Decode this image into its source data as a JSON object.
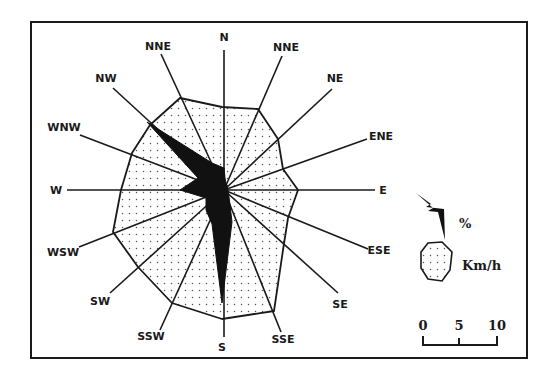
{
  "figure": {
    "type": "wind-rose",
    "frame": {
      "x": 31,
      "y": 22,
      "width": 496,
      "height": 336
    },
    "center": {
      "x": 224,
      "y": 190
    },
    "colors": {
      "line": "#1a1a1a",
      "fill_dots": "#555555",
      "spike": "#111111",
      "background": "#ffffff"
    }
  },
  "directions": [
    {
      "label": "N",
      "line_end": [
        224,
        50
      ],
      "label_pos": [
        224,
        41
      ],
      "speed_vertex": [
        222,
        107
      ],
      "pct_vertex": [
        224,
        168
      ]
    },
    {
      "label": "NNE",
      "line_end": [
        161,
        54
      ],
      "label_pos": [
        158,
        50
      ],
      "speed_vertex": [
        180,
        98
      ],
      "pct_vertex": [
        212,
        163
      ]
    },
    {
      "label": "NW",
      "line_end": [
        113,
        88
      ],
      "label_pos": [
        106,
        82
      ],
      "speed_vertex": [
        150,
        125
      ],
      "pct_vertex": [
        147,
        122
      ]
    },
    {
      "label": "WNW",
      "line_end": [
        80,
        135
      ],
      "label_pos": [
        64,
        131
      ],
      "speed_vertex": [
        132,
        153
      ],
      "pct_vertex": [
        198,
        178
      ]
    },
    {
      "label": "W",
      "line_end": [
        67,
        190
      ],
      "label_pos": [
        56,
        194
      ],
      "speed_vertex": [
        121,
        190
      ],
      "pct_vertex": [
        180,
        190
      ]
    },
    {
      "label": "WSW",
      "line_end": [
        79,
        247
      ],
      "label_pos": [
        63,
        256
      ],
      "speed_vertex": [
        113,
        232
      ],
      "pct_vertex": [
        206,
        198
      ]
    },
    {
      "label": "SW",
      "line_end": [
        110,
        293
      ],
      "label_pos": [
        100,
        305
      ],
      "speed_vertex": [
        138,
        267
      ],
      "pct_vertex": [
        206,
        210
      ]
    },
    {
      "label": "SSW",
      "line_end": [
        160,
        330
      ],
      "label_pos": [
        151,
        340
      ],
      "speed_vertex": [
        172,
        303
      ],
      "pct_vertex": [
        212,
        224
      ]
    },
    {
      "label": "S",
      "line_end": [
        224,
        337
      ],
      "label_pos": [
        222,
        351
      ],
      "speed_vertex": [
        222,
        319
      ],
      "pct_vertex": [
        222,
        303
      ]
    },
    {
      "label": "SSE",
      "line_end": [
        281,
        332
      ],
      "label_pos": [
        283,
        343
      ],
      "speed_vertex": [
        274,
        311
      ],
      "pct_vertex": [
        232,
        222
      ]
    },
    {
      "label": "SE",
      "line_end": [
        338,
        293
      ],
      "label_pos": [
        340,
        308
      ],
      "speed_vertex": [
        283,
        250
      ],
      "pct_vertex": [
        230,
        205
      ]
    },
    {
      "label": "ESE",
      "line_end": [
        368,
        249
      ],
      "label_pos": [
        379,
        254
      ],
      "speed_vertex": [
        288,
        218
      ],
      "pct_vertex": [
        229,
        197
      ]
    },
    {
      "label": "E",
      "line_end": [
        375,
        190
      ],
      "label_pos": [
        383,
        194
      ],
      "speed_vertex": [
        298,
        190
      ],
      "pct_vertex": [
        228,
        191
      ]
    },
    {
      "label": "ENE",
      "line_end": [
        367,
        139
      ],
      "label_pos": [
        381,
        140
      ],
      "speed_vertex": [
        283,
        169
      ],
      "pct_vertex": [
        227,
        186
      ]
    },
    {
      "label": "NE",
      "line_end": [
        332,
        89
      ],
      "label_pos": [
        335,
        82
      ],
      "speed_vertex": [
        278,
        139
      ],
      "pct_vertex": [
        226,
        183
      ]
    },
    {
      "label": "NNE",
      "line_end": [
        282,
        56
      ],
      "label_pos": [
        286,
        51
      ],
      "speed_vertex": [
        258,
        109
      ],
      "pct_vertex": [
        225,
        178
      ]
    }
  ],
  "legend": {
    "spike_label": "%",
    "polygon_label": "Km/h",
    "spike_points": [
      [
        416,
        193
      ],
      [
        431,
        204
      ],
      [
        426,
        207
      ],
      [
        444,
        209
      ],
      [
        445,
        240
      ],
      [
        438,
        212
      ],
      [
        428,
        211
      ],
      [
        433,
        208
      ]
    ],
    "polygon_points": [
      [
        428,
        243
      ],
      [
        442,
        242
      ],
      [
        452,
        252
      ],
      [
        450,
        270
      ],
      [
        442,
        281
      ],
      [
        428,
        279
      ],
      [
        421,
        268
      ],
      [
        421,
        252
      ]
    ],
    "spike_label_pos": [
      459,
      228
    ],
    "polygon_label_pos": [
      462,
      270
    ]
  },
  "scale_bar": {
    "ticks": [
      {
        "label": "0",
        "x": 423
      },
      {
        "label": "5",
        "x": 459
      },
      {
        "label": "10",
        "x": 497
      }
    ],
    "baseline_y": 345,
    "tick_top_y": 336,
    "label_y": 330
  }
}
